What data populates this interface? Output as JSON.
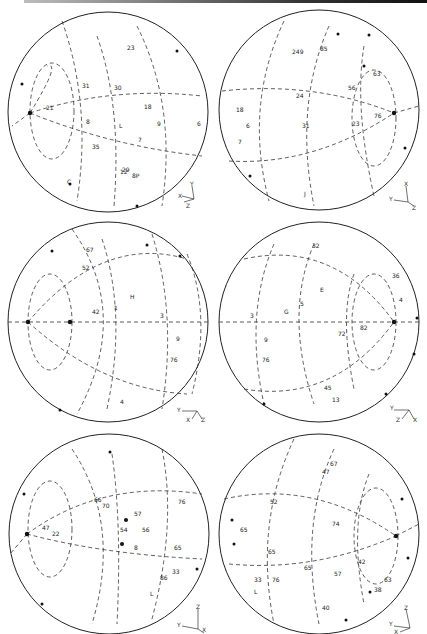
{
  "figure": {
    "title": "",
    "layout": "3 rows x 2 columns of stereographic projections (rotated 90 degrees)",
    "circle_stroke": "#222222",
    "dash_stroke": "#333333"
  },
  "panels": [
    {
      "id": "top-left",
      "axes": {
        "a": "Y",
        "b": "X",
        "c": "Z"
      },
      "labels": [
        "23",
        "31",
        "21",
        "18",
        "9",
        "8",
        "7",
        "35",
        "L",
        "8P",
        "6",
        "12",
        "30",
        "29",
        "C"
      ]
    },
    {
      "id": "top-right",
      "axes": {
        "a": "X",
        "b": "Y",
        "c": "Z"
      },
      "labels": [
        "249",
        "85",
        "56",
        "24",
        "31",
        "23",
        "76",
        "63",
        "18",
        "6",
        "7",
        "J"
      ]
    },
    {
      "id": "middle-left",
      "axes": {
        "a": "Y",
        "b": "X",
        "c": "Z"
      },
      "labels": [
        "42",
        "H",
        "1",
        "3",
        "9",
        "76",
        "52",
        "67",
        "4"
      ]
    },
    {
      "id": "middle-right",
      "axes": {
        "a": "Y",
        "b": "Z",
        "c": "X"
      },
      "labels": [
        "3",
        "G",
        "5",
        "E",
        "72",
        "82",
        "9",
        "76",
        "32",
        "36",
        "4",
        "45",
        "13"
      ]
    },
    {
      "id": "bottom-left",
      "axes": {
        "a": "Z",
        "b": "Y",
        "c": "X"
      },
      "labels": [
        "47",
        "22",
        "66",
        "70",
        "54",
        "57",
        "56",
        "65",
        "8",
        "86",
        "33",
        "76",
        "L",
        "A47"
      ]
    },
    {
      "id": "bottom-right",
      "axes": {
        "a": "Z",
        "b": "Y",
        "c": "X"
      },
      "labels": [
        "74",
        "47",
        "67",
        "52",
        "65",
        "33",
        "76",
        "65",
        "57",
        "42",
        "40",
        "65",
        "38",
        "63",
        "L"
      ]
    }
  ]
}
